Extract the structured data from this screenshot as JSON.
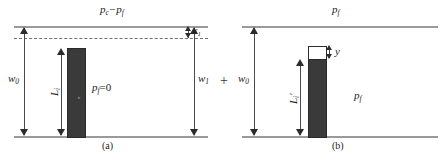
{
  "figure": {
    "caption_a": "(a)",
    "caption_b": "(b)",
    "operator": "+"
  },
  "panel_a": {
    "top_pressure_label": "p",
    "top_pressure_sub": "c",
    "top_pressure_minus": "−p",
    "top_pressure_sub2": "f",
    "left_width_label": "w",
    "left_width_sub": "0",
    "right_width_label": "w",
    "right_width_sub": "1",
    "gap_label": "x",
    "gap_sub": "1",
    "column_length_label": "L",
    "column_length_sub": "i",
    "fluid_pressure_label": "p",
    "fluid_pressure_sub": "f",
    "fluid_pressure_value": "=0",
    "bar_inner_text": "σ"
  },
  "panel_b": {
    "top_pressure_label": "p",
    "top_pressure_sub": "f",
    "left_width_label": "w",
    "left_width_sub": "0",
    "rise_label": "y",
    "column_length_label": "L",
    "column_length_sub": "i",
    "column_length_prime": "′",
    "fluid_pressure_label": "p",
    "fluid_pressure_sub": "f"
  },
  "colors": {
    "bar_fill": "#3a3a3a",
    "rule_line": "#9a9a9a",
    "dash_line": "#6f6f6f",
    "text": "#1c1c1c"
  }
}
